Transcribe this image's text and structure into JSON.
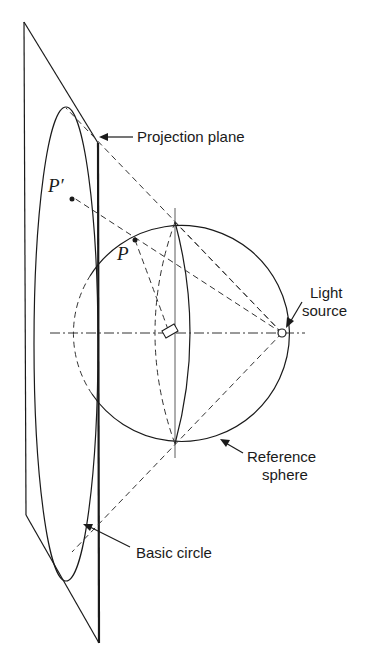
{
  "figure": {
    "type": "stereographic projection diagram",
    "labels": {
      "projection_plane": "Projection plane",
      "light_source_line1": "Light",
      "light_source_line2": "source",
      "reference_sphere_line1": "Reference",
      "reference_sphere_line2": "sphere",
      "basic_circle": "Basic circle",
      "point_p": "P",
      "point_p_prime": "P′"
    },
    "colors": {
      "ink": "#1a1a1a",
      "background": "#ffffff"
    }
  }
}
